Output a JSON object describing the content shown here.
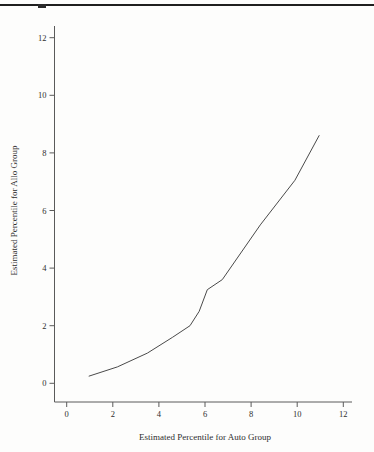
{
  "header": {
    "rule_color": "#1f1f1f",
    "cropped_text_remnant_color": "#2a2a2a"
  },
  "chart_data": {
    "type": "line",
    "title": "",
    "xlabel": "Estimated Percentile for Auto Group",
    "ylabel": "Estimated Percentile for Allo Group",
    "xlim": [
      0,
      12
    ],
    "ylim": [
      0,
      12
    ],
    "xticks": [
      0,
      2,
      4,
      6,
      8,
      10,
      12
    ],
    "yticks": [
      0,
      2,
      4,
      6,
      8,
      10,
      12
    ],
    "grid": false,
    "legend": false,
    "background_color": "#fdfdfc",
    "axis_color": "#5a5a5a",
    "line_color": "#4a4a4a",
    "text_color": "#2e2e2e",
    "series": [
      {
        "name": "Estimated percentiles: Allo group vs Auto group",
        "points": [
          [
            0.97,
            0.25
          ],
          [
            2.2,
            0.57
          ],
          [
            3.5,
            1.05
          ],
          [
            4.6,
            1.6
          ],
          [
            5.35,
            2.0
          ],
          [
            5.75,
            2.5
          ],
          [
            6.1,
            3.25
          ],
          [
            6.75,
            3.6
          ],
          [
            8.4,
            5.5
          ],
          [
            9.9,
            7.05
          ],
          [
            10.95,
            8.6
          ]
        ]
      }
    ]
  }
}
